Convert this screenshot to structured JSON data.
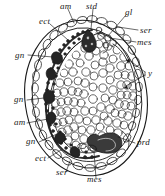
{
  "figure": {
    "type": "scientific-line-drawing",
    "background_color": "#ffffff",
    "ink_color": "#1a1a1a",
    "width": 165,
    "height": 196,
    "labels": [
      {
        "id": "am-top",
        "text": "am",
        "x": 60,
        "y": 5,
        "anchor": "start"
      },
      {
        "id": "std-top",
        "text": "std",
        "x": 86,
        "y": 5,
        "anchor": "start"
      },
      {
        "id": "gl-top",
        "text": "gl",
        "x": 125,
        "y": 11,
        "anchor": "start"
      },
      {
        "id": "ect-upper",
        "text": "ect",
        "x": 39,
        "y": 21,
        "anchor": "start"
      },
      {
        "id": "ser-right",
        "text": "ser",
        "x": 139,
        "y": 31,
        "anchor": "start"
      },
      {
        "id": "mes-right",
        "text": "mes",
        "x": 137,
        "y": 44,
        "anchor": "start"
      },
      {
        "id": "gn-upper",
        "text": "gn",
        "x": 15,
        "y": 56,
        "anchor": "start"
      },
      {
        "id": "y-right",
        "text": "y",
        "x": 146,
        "y": 73,
        "anchor": "start"
      },
      {
        "id": "gn-mid",
        "text": "gn",
        "x": 14,
        "y": 101,
        "anchor": "start"
      },
      {
        "id": "am-left",
        "text": "am",
        "x": 14,
        "y": 124,
        "anchor": "start"
      },
      {
        "id": "gn-lower",
        "text": "gn",
        "x": 27,
        "y": 144,
        "anchor": "start"
      },
      {
        "id": "prd-right",
        "text": "prd",
        "x": 136,
        "y": 144,
        "anchor": "start"
      },
      {
        "id": "ect-lower",
        "text": "ect",
        "x": 36,
        "y": 160,
        "anchor": "start"
      },
      {
        "id": "ser-bottom",
        "text": "ser",
        "x": 57,
        "y": 175,
        "anchor": "start"
      },
      {
        "id": "mes-bottom",
        "text": "mes",
        "x": 88,
        "y": 180,
        "anchor": "start"
      }
    ],
    "structures": {
      "chorion": "outer egg shell outline",
      "serosa": "ser",
      "amnion": "am",
      "ectoderm": "ect",
      "mesoderm": "mes",
      "stomodaeum": "std",
      "proctodaeum": "prd",
      "yolk": "y",
      "ganglion": "gn",
      "germ_layer_cells": "gl"
    }
  }
}
